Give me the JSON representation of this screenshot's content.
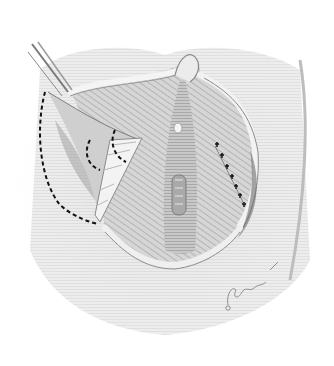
{
  "figure": {
    "style": "grayscale pencil drawing",
    "signature": "artist signature with copyright mark",
    "annotations": {
      "dashed_incision_lines": 3,
      "suture_marks": 7
    },
    "colors": {
      "background": "#ffffff",
      "tissue_light": "#e6e6e6",
      "tissue_mid": "#c4c4c4",
      "tissue_dark": "#8e8e8e",
      "shadow": "#6a6a6a",
      "dashes": "#111111"
    }
  }
}
